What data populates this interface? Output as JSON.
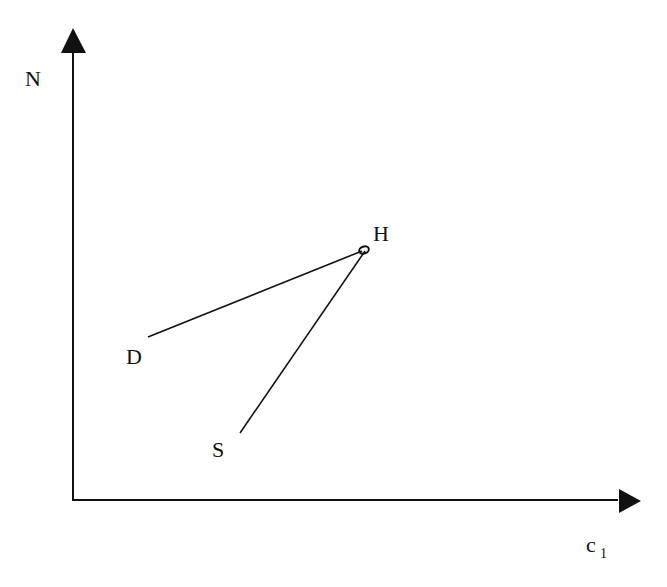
{
  "diagram": {
    "axes": {
      "y_label": "N",
      "x_label_main": "c",
      "x_label_sub": "1"
    },
    "points": [
      {
        "id": "H",
        "label": "H"
      },
      {
        "id": "D",
        "label": "D"
      },
      {
        "id": "S",
        "label": "S"
      }
    ],
    "edges": [
      {
        "from": "D",
        "to": "H"
      },
      {
        "from": "S",
        "to": "H"
      }
    ],
    "colors": {
      "ink": "#111111",
      "background": "#ffffff"
    }
  }
}
